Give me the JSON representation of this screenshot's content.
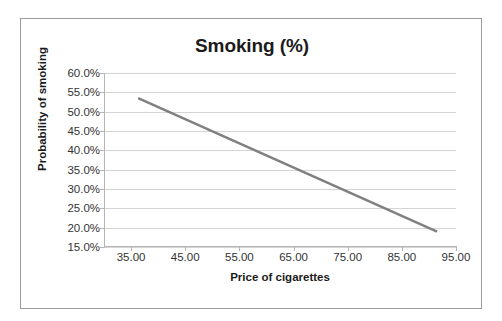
{
  "chart_data": {
    "type": "line",
    "title": "Smoking (%)",
    "xlabel": "Price of cigarettes",
    "ylabel": "Probability of smoking",
    "xlim": [
      30.0,
      95.0
    ],
    "ylim": [
      0.15,
      0.6
    ],
    "grid": true,
    "legend": "none",
    "line_color": "#808080",
    "line_width": 2.5,
    "x_tick_labels": [
      "35.00",
      "45.00",
      "55.00",
      "65.00",
      "75.00",
      "85.00",
      "95.00"
    ],
    "x_tick_values": [
      35,
      45,
      55,
      65,
      75,
      85,
      95
    ],
    "y_tick_labels": [
      "15.0%",
      "20.0%",
      "25.0%",
      "30.0%",
      "35.0%",
      "40.0%",
      "45.0%",
      "50.0%",
      "55.0%",
      "60.0%"
    ],
    "y_tick_values": [
      0.15,
      0.2,
      0.25,
      0.3,
      0.35,
      0.4,
      0.45,
      0.5,
      0.55,
      0.6
    ],
    "series": [
      {
        "name": "Probability of smoking",
        "x": [
          36.3,
          91.5
        ],
        "values": [
          0.535,
          0.19
        ]
      }
    ],
    "annotations": []
  },
  "frame": {
    "border_color": "#9a9a9a",
    "background": "#ffffff"
  }
}
